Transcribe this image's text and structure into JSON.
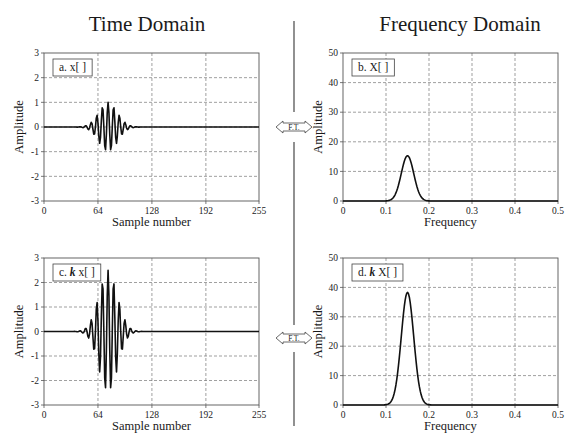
{
  "titles": {
    "time": "Time Domain",
    "frequency": "Frequency Domain"
  },
  "transform_label": "F.T.",
  "colors": {
    "line": "#111111",
    "axis": "#555555",
    "grid": "#777777",
    "divider": "#555555"
  },
  "chart_data": [
    {
      "id": "a",
      "type": "line",
      "legend": "a.  x[ ]",
      "legend_italic_prefix": "",
      "xlabel": "Sample number",
      "ylabel": "Amplitude",
      "xlim": [
        0,
        255
      ],
      "ylim": [
        -3,
        3
      ],
      "xticks": [
        0,
        64,
        128,
        192,
        255
      ],
      "yticks": [
        -3,
        -2,
        -1,
        0,
        1,
        2,
        3
      ],
      "grid": true,
      "signal": {
        "kind": "gaussian_burst",
        "center": 76,
        "sigma": 11,
        "frequency": 0.15,
        "amplitude": 1.0,
        "n": 256
      },
      "description": "Gaussian-windowed sinusoid centered near sample 76, peak amplitude about 1"
    },
    {
      "id": "b",
      "type": "line",
      "legend": "b.  X[ ]",
      "legend_italic_prefix": "",
      "xlabel": "Frequency",
      "ylabel": "Amplitude",
      "xlim": [
        0,
        0.5
      ],
      "ylim": [
        0,
        50
      ],
      "xticks": [
        0,
        0.1,
        0.2,
        0.3,
        0.4,
        0.5
      ],
      "yticks": [
        0,
        10,
        20,
        30,
        40,
        50
      ],
      "grid": true,
      "signal": {
        "kind": "gaussian_peak",
        "center": 0.15,
        "sigma": 0.0145,
        "peak": 15.3,
        "n": 257
      },
      "description": "Gaussian magnitude spectrum peaking at about 15 at frequency 0.15"
    },
    {
      "id": "c",
      "type": "line",
      "legend": "x[ ]",
      "legend_prefix": "c.",
      "legend_italic_prefix": "k",
      "xlabel": "Sample number",
      "ylabel": "Amplitude",
      "xlim": [
        0,
        255
      ],
      "ylim": [
        -3,
        3
      ],
      "xticks": [
        0,
        64,
        128,
        192,
        255
      ],
      "yticks": [
        -3,
        -2,
        -1,
        0,
        1,
        2,
        3
      ],
      "grid": true,
      "signal": {
        "kind": "gaussian_burst",
        "center": 76,
        "sigma": 11,
        "frequency": 0.15,
        "amplitude": 2.5,
        "n": 256
      },
      "description": "Same burst scaled by k (about 2.5), peak amplitude about 2.5"
    },
    {
      "id": "d",
      "type": "line",
      "legend": "X[ ]",
      "legend_prefix": "d.",
      "legend_italic_prefix": "k",
      "xlabel": "Frequency",
      "ylabel": "Amplitude",
      "xlim": [
        0,
        0.5
      ],
      "ylim": [
        0,
        50
      ],
      "xticks": [
        0,
        0.1,
        0.2,
        0.3,
        0.4,
        0.5
      ],
      "yticks": [
        0,
        10,
        20,
        30,
        40,
        50
      ],
      "grid": true,
      "signal": {
        "kind": "gaussian_peak",
        "center": 0.15,
        "sigma": 0.0145,
        "peak": 38.3,
        "n": 257
      },
      "description": "Spectrum scaled by k, peaking at about 38 at frequency 0.15"
    }
  ]
}
